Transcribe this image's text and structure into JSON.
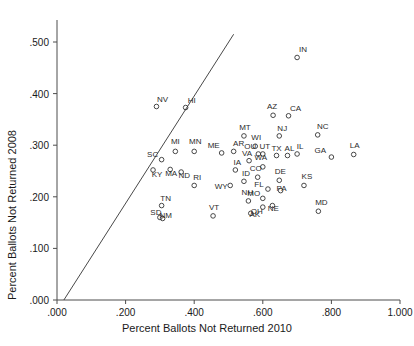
{
  "chart_data": {
    "type": "scatter",
    "title": "",
    "xlabel": "Percent Ballots Not Returned 2010",
    "ylabel": "Percent Ballots Not Returned 2008",
    "xlim": [
      0.0,
      1.0
    ],
    "ylim": [
      0.0,
      0.5
    ],
    "xticks": [
      ".000",
      ".200",
      ".400",
      ".600",
      ".800",
      "1.000"
    ],
    "xtick_values": [
      0.0,
      0.2,
      0.4,
      0.6,
      0.8,
      1.0
    ],
    "yticks": [
      ".000",
      ".100",
      ".200",
      ".300",
      ".400",
      ".500"
    ],
    "ytick_values": [
      0.0,
      0.1,
      0.2,
      0.3,
      0.4,
      0.5
    ],
    "grid": false,
    "legend": "none",
    "annotations": [
      {
        "name": "forty-five-degree-reference-line",
        "description": "45 degree diagonal line y = x",
        "x0": 0.02,
        "y0": 0.0,
        "x1": 0.515,
        "y1": 0.515
      }
    ],
    "point_label_field": "state",
    "points": [
      {
        "state": "NV",
        "x": 0.29,
        "y": 0.375,
        "lx": 6,
        "ly": -5
      },
      {
        "state": "HI",
        "x": 0.375,
        "y": 0.373,
        "lx": 6,
        "ly": -5
      },
      {
        "state": "IN",
        "x": 0.7,
        "y": 0.47,
        "lx": 6,
        "ly": -5
      },
      {
        "state": "AZ",
        "x": 0.63,
        "y": 0.358,
        "lx": -1,
        "ly": -6
      },
      {
        "state": "CA",
        "x": 0.675,
        "y": 0.357,
        "lx": 7,
        "ly": -5
      },
      {
        "state": "NC",
        "x": 0.76,
        "y": 0.32,
        "lx": 5,
        "ly": -6
      },
      {
        "state": "MT",
        "x": 0.545,
        "y": 0.318,
        "lx": 1,
        "ly": -6
      },
      {
        "state": "NJ",
        "x": 0.648,
        "y": 0.318,
        "lx": 3,
        "ly": -5
      },
      {
        "state": "WI",
        "x": 0.578,
        "y": 0.298,
        "lx": 1,
        "ly": -6
      },
      {
        "state": "MN",
        "x": 0.4,
        "y": 0.288,
        "lx": 1,
        "ly": -7
      },
      {
        "state": "MI",
        "x": 0.345,
        "y": 0.288,
        "lx": 0,
        "ly": -7
      },
      {
        "state": "SC",
        "x": 0.305,
        "y": 0.272,
        "lx": -9,
        "ly": -3
      },
      {
        "state": "ME",
        "x": 0.48,
        "y": 0.285,
        "lx": -8,
        "ly": -5
      },
      {
        "state": "AR",
        "x": 0.515,
        "y": 0.288,
        "lx": 5,
        "ly": -5
      },
      {
        "state": "UT",
        "x": 0.6,
        "y": 0.283,
        "lx": 2,
        "ly": -5
      },
      {
        "state": "OU",
        "x": 0.587,
        "y": 0.283,
        "lx": -8,
        "ly": -5
      },
      {
        "state": "TX",
        "x": 0.64,
        "y": 0.28,
        "lx": 0,
        "ly": -5
      },
      {
        "state": "AL",
        "x": 0.672,
        "y": 0.28,
        "lx": 2,
        "ly": -5
      },
      {
        "state": "IL",
        "x": 0.7,
        "y": 0.283,
        "lx": 3,
        "ly": -5
      },
      {
        "state": "GA",
        "x": 0.8,
        "y": 0.277,
        "lx": -11,
        "ly": -4
      },
      {
        "state": "LA",
        "x": 0.865,
        "y": 0.282,
        "lx": 1,
        "ly": -6
      },
      {
        "state": "VA",
        "x": 0.56,
        "y": 0.27,
        "lx": -2,
        "ly": -5
      },
      {
        "state": "WA",
        "x": 0.6,
        "y": 0.258,
        "lx": -2,
        "ly": -7
      },
      {
        "state": "KY",
        "x": 0.28,
        "y": 0.252,
        "lx": 4,
        "ly": 7
      },
      {
        "state": "MA",
        "x": 0.33,
        "y": 0.253,
        "lx": 1,
        "ly": 7
      },
      {
        "state": "ND",
        "x": 0.362,
        "y": 0.248,
        "lx": 3,
        "ly": 6
      },
      {
        "state": "IA",
        "x": 0.52,
        "y": 0.252,
        "lx": 2,
        "ly": -5
      },
      {
        "state": "CO",
        "x": 0.585,
        "y": 0.238,
        "lx": -2,
        "ly": -6
      },
      {
        "state": "ID",
        "x": 0.545,
        "y": 0.23,
        "lx": 2,
        "ly": -5
      },
      {
        "state": "DE",
        "x": 0.648,
        "y": 0.232,
        "lx": 1,
        "ly": -6
      },
      {
        "state": "KS",
        "x": 0.72,
        "y": 0.222,
        "lx": 3,
        "ly": -6
      },
      {
        "state": "RI",
        "x": 0.4,
        "y": 0.222,
        "lx": 3,
        "ly": -5
      },
      {
        "state": "WY",
        "x": 0.505,
        "y": 0.222,
        "lx": -9,
        "ly": 4
      },
      {
        "state": "FL",
        "x": 0.615,
        "y": 0.215,
        "lx": -9,
        "ly": -2
      },
      {
        "state": "PA",
        "x": 0.652,
        "y": 0.212,
        "lx": 1,
        "ly": 0
      },
      {
        "state": "MO",
        "x": 0.6,
        "y": 0.197,
        "lx": -9,
        "ly": -2
      },
      {
        "state": "NH",
        "x": 0.558,
        "y": 0.192,
        "lx": -1,
        "ly": -6
      },
      {
        "state": "TN",
        "x": 0.305,
        "y": 0.183,
        "lx": 4,
        "ly": -5
      },
      {
        "state": "MD",
        "x": 0.762,
        "y": 0.172,
        "lx": 3,
        "ly": -6
      },
      {
        "state": "NE",
        "x": 0.628,
        "y": 0.183,
        "lx": 1,
        "ly": 5
      },
      {
        "state": "OH",
        "x": 0.6,
        "y": 0.18,
        "lx": -6,
        "ly": 7
      },
      {
        "state": "AK",
        "x": 0.565,
        "y": 0.168,
        "lx": 4,
        "ly": 4
      },
      {
        "state": "VT",
        "x": 0.455,
        "y": 0.163,
        "lx": 1,
        "ly": -6
      },
      {
        "state": "SD",
        "x": 0.3,
        "y": 0.16,
        "lx": -4,
        "ly": -2
      },
      {
        "state": "NM",
        "x": 0.308,
        "y": 0.158,
        "lx": 3,
        "ly": 0
      }
    ]
  }
}
